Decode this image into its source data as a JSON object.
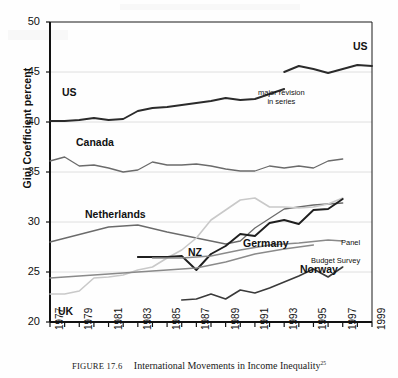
{
  "figure": {
    "caption_number": "FIGURE 17.6",
    "caption_text": "International Movements in Income Inequality",
    "caption_footnote": "25"
  },
  "chart_data": {
    "type": "line",
    "title": "",
    "xlabel": "",
    "ylabel": "Gini Coefficient percent",
    "xlim": [
      1977,
      1999
    ],
    "ylim": [
      20,
      50
    ],
    "yticks": [
      20,
      25,
      30,
      35,
      40,
      45,
      50
    ],
    "xticks": [
      1977,
      1978,
      1979,
      1980,
      1981,
      1982,
      1983,
      1984,
      1985,
      1986,
      1987,
      1988,
      1989,
      1990,
      1991,
      1992,
      1993,
      1994,
      1995,
      1996,
      1997,
      1998,
      1999
    ],
    "xtick_labels": [
      "1977",
      "1979",
      "1981",
      "1983",
      "1985",
      "1987",
      "1989",
      "1991",
      "1993",
      "1995",
      "1997",
      "1999"
    ],
    "xtick_label_years": [
      1977,
      1979,
      1981,
      1983,
      1985,
      1987,
      1989,
      1991,
      1993,
      1995,
      1997,
      1999
    ],
    "grid": "horizontal",
    "legend": "inline-labels",
    "series": [
      {
        "name": "US",
        "label": "US",
        "color": "#2b2b2b",
        "width": 1.9,
        "x": [
          1977,
          1978,
          1979,
          1980,
          1981,
          1982,
          1983,
          1984,
          1985,
          1986,
          1987,
          1988,
          1989,
          1990,
          1991,
          1992,
          1993
        ],
        "values": [
          40.1,
          40.1,
          40.2,
          40.4,
          40.2,
          40.3,
          41.1,
          41.4,
          41.5,
          41.7,
          41.9,
          42.1,
          42.4,
          42.2,
          42.3,
          42.8,
          43.3
        ]
      },
      {
        "name": "US-revised",
        "label": "US",
        "color": "#2b2b2b",
        "width": 1.9,
        "x": [
          1993,
          1994,
          1995,
          1996,
          1997,
          1998,
          1999
        ],
        "values": [
          45.0,
          45.6,
          45.3,
          44.9,
          45.3,
          45.7,
          45.6
        ]
      },
      {
        "name": "Canada",
        "label": "Canada",
        "color": "#6b6b6b",
        "width": 1.3,
        "x": [
          1977,
          1978,
          1979,
          1980,
          1981,
          1982,
          1983,
          1984,
          1985,
          1986,
          1987,
          1988,
          1989,
          1990,
          1991,
          1992,
          1993,
          1994,
          1995,
          1996,
          1997
        ],
        "values": [
          36.1,
          36.5,
          35.6,
          35.7,
          35.4,
          35.0,
          35.2,
          36.0,
          35.7,
          35.7,
          35.8,
          35.6,
          35.3,
          35.1,
          35.1,
          35.6,
          35.4,
          35.6,
          35.4,
          36.1,
          36.3
        ]
      },
      {
        "name": "Netherlands",
        "label": "Netherlands",
        "color": "#6b6b6b",
        "width": 1.3,
        "x": [
          1977,
          1981,
          1983,
          1985,
          1987,
          1989,
          1990,
          1991,
          1993,
          1995,
          1997
        ],
        "values": [
          28.0,
          29.5,
          29.7,
          29.0,
          28.4,
          27.8,
          28.1,
          29.4,
          31.3,
          31.7,
          31.9
        ]
      },
      {
        "name": "UK",
        "label": "UK",
        "color": "#c9c9c9",
        "width": 1.6,
        "x": [
          1977,
          1978,
          1979,
          1980,
          1981,
          1982,
          1983,
          1984,
          1985,
          1986,
          1987,
          1988,
          1989,
          1990,
          1991,
          1992,
          1993,
          1994,
          1995,
          1996,
          1997
        ],
        "values": [
          22.8,
          22.8,
          23.1,
          24.4,
          24.5,
          24.7,
          25.2,
          25.5,
          26.4,
          27.2,
          28.4,
          30.2,
          31.2,
          32.2,
          32.4,
          31.5,
          31.5,
          31.4,
          31.5,
          31.8,
          32.4
        ]
      },
      {
        "name": "NZ",
        "label": "NZ",
        "color": "#1f1f1f",
        "width": 1.9,
        "x": [
          1983,
          1984,
          1985,
          1986,
          1987,
          1988,
          1989,
          1990,
          1991,
          1992,
          1993,
          1994,
          1995,
          1996,
          1997
        ],
        "values": [
          26.5,
          26.5,
          26.5,
          26.6,
          25.2,
          26.8,
          27.6,
          28.8,
          28.6,
          29.9,
          30.2,
          29.8,
          31.2,
          31.3,
          32.3
        ]
      },
      {
        "name": "Germany-panel",
        "label": "Panel",
        "color": "#8a8a8a",
        "width": 1.3,
        "x": [
          1984,
          1986,
          1988,
          1990,
          1992,
          1994,
          1996,
          1997
        ],
        "values": [
          26.4,
          26.4,
          26.6,
          27.2,
          27.7,
          27.9,
          28.2,
          28.1
        ]
      },
      {
        "name": "Germany-budget-survey",
        "label": "Budget Survey",
        "color": "#8a8a8a",
        "width": 1.3,
        "x": [
          1977,
          1980,
          1983,
          1985,
          1987,
          1989,
          1991,
          1993,
          1995
        ],
        "values": [
          24.4,
          24.7,
          25.0,
          25.2,
          25.4,
          26.0,
          26.8,
          27.3,
          27.7
        ]
      },
      {
        "name": "Norway",
        "label": "Norway",
        "color": "#3a3a3a",
        "width": 1.6,
        "x": [
          1986,
          1987,
          1988,
          1989,
          1990,
          1991,
          1992,
          1993,
          1994,
          1995,
          1996,
          1997
        ],
        "values": [
          22.2,
          22.3,
          22.8,
          22.3,
          23.2,
          22.9,
          23.4,
          24.0,
          24.6,
          25.3,
          24.5,
          25.5
        ]
      }
    ],
    "annotations": [
      {
        "name": "major-revision",
        "line1": "major revision",
        "line2": "in series",
        "x": 1993.4,
        "y": 43.5
      }
    ]
  },
  "axis": {
    "y_label": "Gini Coefficient percent",
    "y_tick_labels": [
      "50",
      "45",
      "40",
      "35",
      "30",
      "25",
      "20"
    ],
    "x_tick_labels": [
      "1977",
      "1979",
      "1981",
      "1983",
      "1985",
      "1987",
      "1989",
      "1991",
      "1993",
      "1995",
      "1997",
      "1999"
    ]
  },
  "series_labels": [
    {
      "name": "us-upper",
      "text": "US",
      "left": 353,
      "top": 40
    },
    {
      "name": "us-lower",
      "text": "US",
      "left": 62,
      "top": 86
    },
    {
      "name": "canada",
      "text": "Canada",
      "left": 76,
      "top": 136
    },
    {
      "name": "netherlands",
      "text": "Netherlands",
      "left": 85,
      "top": 208
    },
    {
      "name": "nz",
      "text": "NZ",
      "left": 188,
      "top": 246
    },
    {
      "name": "germany",
      "text": "Germany",
      "left": 243,
      "top": 237
    },
    {
      "name": "norway",
      "text": "Norway",
      "left": 300,
      "top": 263
    },
    {
      "name": "uk",
      "text": "UK",
      "left": 58,
      "top": 305
    }
  ],
  "sub_labels": [
    {
      "name": "panel",
      "text": "Panel",
      "left": 341,
      "top": 238
    },
    {
      "name": "budget-survey",
      "text": "Budget Survey",
      "left": 311,
      "top": 256
    }
  ]
}
